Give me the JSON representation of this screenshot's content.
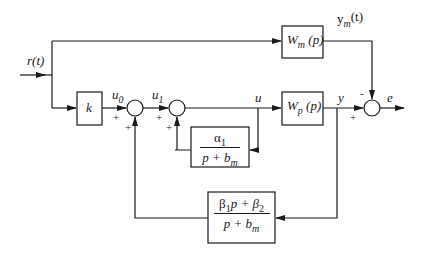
{
  "diagram": {
    "signals": {
      "input": "r(t)",
      "u0": "u",
      "u0_sub": "0",
      "u1": "u",
      "u1_sub": "1",
      "u": "u",
      "y": "y",
      "e": "e",
      "ym": "y",
      "ym_sub": "m",
      "ym_arg": "(t)"
    },
    "blocks": {
      "gain": "k",
      "model": {
        "base": "W",
        "sub": "m",
        "arg": " (p)"
      },
      "plant": {
        "base": "W",
        "sub": "p",
        "arg": " (p)"
      },
      "alpha_filter": {
        "num": "α",
        "num_sub": "1",
        "den": "p + b",
        "den_sub": "m"
      },
      "beta_filter": {
        "num_a": "β",
        "num_a_sub": "1",
        "num_b": "p + β",
        "num_b_sub": "2",
        "den": "p + b",
        "den_sub": "m"
      }
    },
    "signs": {
      "sum1_left": "+",
      "sum1_bottom": "+",
      "sum2_left": "+",
      "sum2_bottom": "+",
      "sum3_left": "+",
      "sum3_top": "-"
    }
  }
}
